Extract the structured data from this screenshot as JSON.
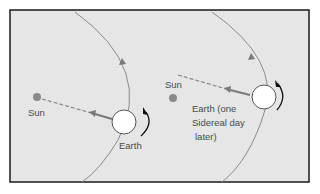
{
  "diagram": {
    "colors": {
      "background": "#e6e6e6",
      "frame": "#1a1a1a",
      "orbit": "#8a8a8a",
      "sun": "#8a8a8a",
      "earth_fill": "#ffffff",
      "arrow": "#7a7a7a",
      "rotation_arrow": "#111111",
      "text": "#4a4a4a"
    },
    "left_panel": {
      "sun_label": "Sun",
      "earth_label": "Earth"
    },
    "right_panel": {
      "sun_label": "Sun",
      "earth_label_lines": [
        "Earth (one",
        "Sidereal day",
        "later)"
      ]
    }
  }
}
